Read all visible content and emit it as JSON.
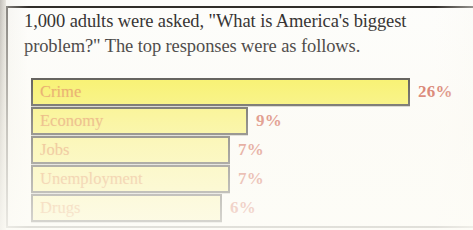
{
  "headline": {
    "line1": "1,000 adults were asked, \"What is America's biggest",
    "line2": "problem?\"  The top responses were as follows."
  },
  "chart_data": {
    "type": "bar",
    "orientation": "horizontal",
    "title": "1,000 adults were asked, \"What is America's biggest problem?\"  The top responses were as follows.",
    "xlabel": "",
    "ylabel": "",
    "categories": [
      "Crime",
      "Economy",
      "Jobs",
      "Unemployment",
      "Drugs"
    ],
    "values": [
      26,
      9,
      7,
      7,
      6
    ],
    "value_labels": [
      "26%",
      "9%",
      "7%",
      "7%",
      "6%"
    ],
    "unit": "%",
    "xlim": [
      0,
      26
    ],
    "grid": false,
    "legend": "none",
    "bar_color": "#f5ec30",
    "bar_border_color": "#191714",
    "label_color": "#df8320",
    "value_color": "#c6412c"
  },
  "bars": [
    {
      "label": "Crime",
      "value_label": "26%",
      "width_px": 379,
      "fill": "#f6ee34"
    },
    {
      "label": "Economy",
      "value_label": "9%",
      "width_px": 217,
      "fill": "#f8f04e"
    },
    {
      "label": "Jobs",
      "value_label": "7%",
      "width_px": 199,
      "fill": "#faf26a"
    },
    {
      "label": "Unemployment",
      "value_label": "7%",
      "width_px": 199,
      "fill": "#faf279"
    },
    {
      "label": "Drugs",
      "value_label": "6%",
      "width_px": 191,
      "fill": "#fbf48e"
    }
  ]
}
